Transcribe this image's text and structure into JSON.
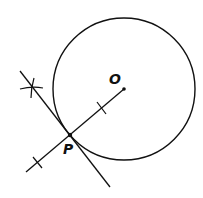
{
  "diagram": {
    "labels": {
      "center": "O",
      "point": "P"
    },
    "colors": {
      "stroke": "#111111",
      "background": "#ffffff"
    },
    "circle": {
      "cx": 124,
      "cy": 89,
      "r": 71
    },
    "points": {
      "O": {
        "x": 124,
        "y": 89
      },
      "P": {
        "x": 70,
        "y": 135
      }
    },
    "radius_line": {
      "x1": 124,
      "y1": 89,
      "x2": 26,
      "y2": 172
    },
    "tangent_line": {
      "x1": 20,
      "y1": 71,
      "x2": 110,
      "y2": 187
    },
    "tick_marks": [
      {
        "x": 102,
        "y": 108
      },
      {
        "x": 38,
        "y": 163
      }
    ],
    "arc_cross": {
      "x": 32,
      "y": 88
    }
  }
}
